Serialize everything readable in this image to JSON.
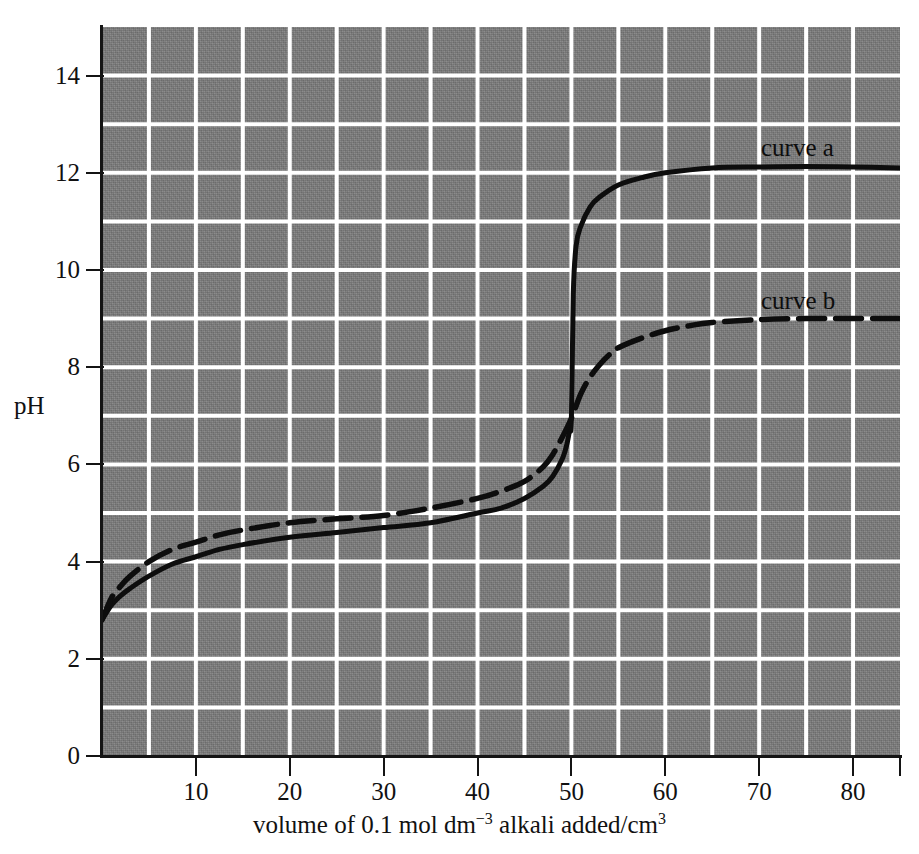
{
  "chart_data": {
    "type": "line",
    "title": "",
    "xlabel": "volume of 0.1 mol dm−3 alkali added/cm³",
    "xlabel_parts": {
      "pre": "volume of 0.1 mol dm",
      "sup1": "−3",
      "mid": " alkali added/cm",
      "sup2": "3"
    },
    "ylabel": "pH",
    "xlim": [
      0,
      85
    ],
    "ylim": [
      0,
      15
    ],
    "x_ticks": [
      10,
      20,
      30,
      40,
      50,
      60,
      70,
      80
    ],
    "x_tick_labels": [
      "10",
      "20",
      "30",
      "40",
      "50",
      "60",
      "70",
      "80"
    ],
    "y_ticks": [
      0,
      2,
      4,
      6,
      8,
      10,
      12,
      14
    ],
    "y_tick_labels": [
      "0",
      "2",
      "4",
      "6",
      "8",
      "10",
      "12",
      "14"
    ],
    "x_gridline_step": 5,
    "y_gridline_step": 1,
    "grid": true,
    "grid_color": "#ffffff",
    "plot_background": "#797979",
    "axis_color": "#141414",
    "legend_position": "inline-annotation",
    "series": [
      {
        "name": "curve a",
        "label": "curve a",
        "style": "solid",
        "color": "#0d0d0d",
        "x": [
          0,
          1,
          2,
          3,
          5,
          7.5,
          10,
          12.5,
          15,
          20,
          25,
          30,
          35,
          40,
          42.5,
          45,
          47,
          48,
          49,
          49.5,
          49.8,
          50,
          50.2,
          50.5,
          51,
          52,
          53,
          55,
          57.5,
          60,
          65,
          70,
          75,
          80,
          85
        ],
        "y": [
          2.8,
          3.1,
          3.3,
          3.45,
          3.7,
          3.95,
          4.1,
          4.25,
          4.35,
          4.5,
          4.6,
          4.7,
          4.8,
          5.0,
          5.1,
          5.3,
          5.55,
          5.75,
          6.1,
          6.4,
          6.7,
          6.95,
          9.5,
          10.5,
          10.9,
          11.3,
          11.5,
          11.75,
          11.9,
          12.0,
          12.1,
          12.12,
          12.13,
          12.12,
          12.1
        ]
      },
      {
        "name": "curve b",
        "label": "curve b",
        "style": "dashed",
        "color": "#0d0d0d",
        "x": [
          0,
          1,
          2,
          3,
          5,
          7.5,
          10,
          12.5,
          15,
          20,
          25,
          30,
          35,
          40,
          42.5,
          45,
          47,
          48,
          49,
          50,
          51,
          52,
          53,
          54,
          55,
          57.5,
          60,
          62.5,
          65,
          70,
          75,
          80,
          85
        ],
        "y": [
          2.8,
          3.25,
          3.5,
          3.7,
          4.0,
          4.25,
          4.4,
          4.55,
          4.65,
          4.8,
          4.88,
          4.95,
          5.1,
          5.3,
          5.45,
          5.65,
          5.95,
          6.2,
          6.55,
          6.95,
          7.45,
          7.8,
          8.05,
          8.25,
          8.4,
          8.6,
          8.75,
          8.85,
          8.92,
          8.98,
          9.0,
          9.0,
          9.0
        ]
      }
    ],
    "annotations": [
      {
        "text": "curve a",
        "x": 69,
        "y": 12.9
      },
      {
        "text": "curve b",
        "x": 69,
        "y": 9.75
      }
    ]
  }
}
